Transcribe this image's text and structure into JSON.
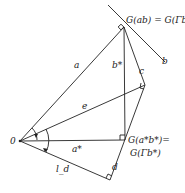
{
  "diagram": {
    "points": {
      "O": {
        "x": 20,
        "y": 141,
        "label": "0"
      },
      "top": {
        "x": 124,
        "y": 27,
        "label": "G(ab) = G(Γb)"
      },
      "c_corner": {
        "x": 145,
        "y": 85
      },
      "mid": {
        "x": 125,
        "y": 140,
        "label_line1": "G(a*b*)=",
        "label_line2": "G(Γb*)"
      },
      "bottom": {
        "x": 110,
        "y": 180
      }
    },
    "labels": {
      "a": "a",
      "b": "b",
      "b_star": "b*",
      "c": "c",
      "e": "e",
      "a_star": "a*",
      "d": "d",
      "l_d": "l_d",
      "origin": "0",
      "top": "G(ab) = G(Γb)",
      "mid1": "G(a*b*)=",
      "mid2": "G(Γb*)"
    }
  }
}
